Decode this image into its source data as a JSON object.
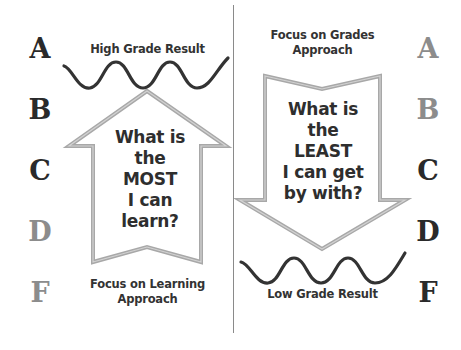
{
  "colors": {
    "dark_grade": "#2a2a2a",
    "light_grade": "#8c8c8c",
    "arrow_outline": "#9a9a9a",
    "wave": "#333333",
    "divider": "#8a8a8a"
  },
  "left_panel": {
    "grades": [
      {
        "letter": "A",
        "emphasis": "dark"
      },
      {
        "letter": "B",
        "emphasis": "dark"
      },
      {
        "letter": "C",
        "emphasis": "dark"
      },
      {
        "letter": "D",
        "emphasis": "light"
      },
      {
        "letter": "F",
        "emphasis": "light"
      }
    ],
    "top_label": "High Grade Result",
    "arrow": {
      "direction": "up",
      "lines": [
        "What is",
        "the",
        "MOST",
        "I can",
        "learn?"
      ]
    },
    "bottom_label_lines": [
      "Focus on Learning",
      "Approach"
    ]
  },
  "right_panel": {
    "grades": [
      {
        "letter": "A",
        "emphasis": "light"
      },
      {
        "letter": "B",
        "emphasis": "light"
      },
      {
        "letter": "C",
        "emphasis": "dark"
      },
      {
        "letter": "D",
        "emphasis": "dark"
      },
      {
        "letter": "F",
        "emphasis": "dark"
      }
    ],
    "top_label_lines": [
      "Focus on Grades",
      "Approach"
    ],
    "arrow": {
      "direction": "down",
      "lines": [
        "What is",
        "the",
        "LEAST",
        "I can get",
        "by with?"
      ]
    },
    "bottom_label": "Low Grade Result"
  }
}
